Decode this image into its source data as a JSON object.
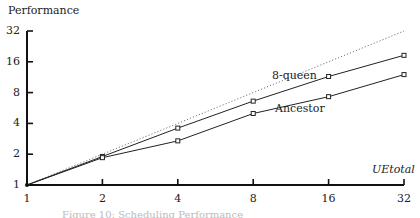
{
  "chart_data": {
    "type": "line",
    "title": "",
    "xlabel": "UEtotal",
    "ylabel": "Performance",
    "xscale": "log2",
    "yscale": "log2",
    "xlim": [
      1,
      32
    ],
    "ylim": [
      1,
      32
    ],
    "x_ticks": [
      "1",
      "2",
      "4",
      "8",
      "16",
      "32"
    ],
    "y_ticks": [
      "1",
      "2",
      "4",
      "8",
      "16",
      "32"
    ],
    "grid": false,
    "legend": "inline labels",
    "x": [
      1,
      2,
      4,
      8,
      16,
      32
    ],
    "series": [
      {
        "name": "ideal",
        "style": "dotted",
        "values": [
          1,
          2,
          4,
          8,
          16,
          32
        ]
      },
      {
        "name": "8-queen",
        "style": "solid",
        "marker": "square",
        "values": [
          1,
          1.9,
          3.6,
          6.6,
          11.5,
          18.5
        ]
      },
      {
        "name": "Ancestor",
        "style": "solid",
        "marker": "square",
        "values": [
          1,
          1.85,
          2.7,
          5.0,
          7.3,
          12.0
        ]
      }
    ],
    "annotations": [
      "8-queen",
      "Ancestor"
    ]
  },
  "labels": {
    "ylabel": "Performance",
    "xlabel": "UEtotal",
    "series_8queen": "8-queen",
    "series_ancestor": "Ancestor",
    "caption": "Figure 10: Scheduling Performance"
  }
}
